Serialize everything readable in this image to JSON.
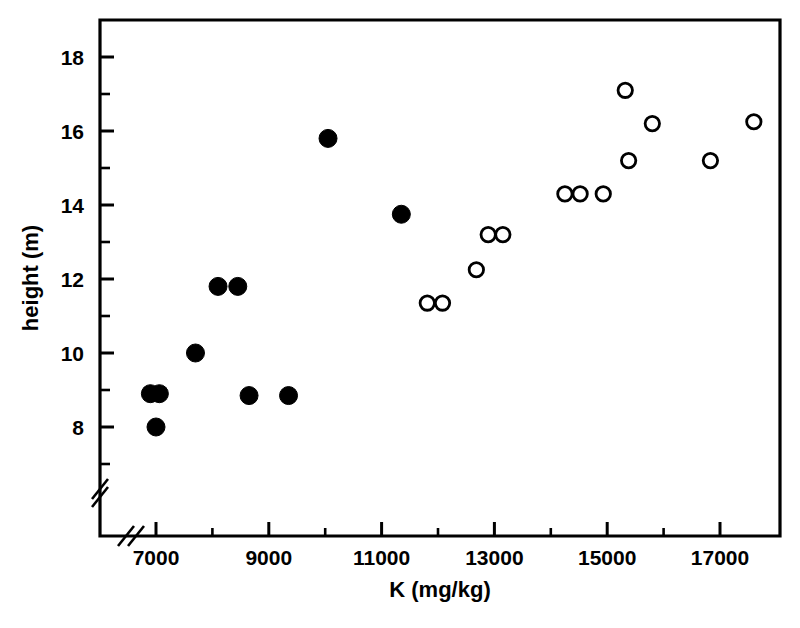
{
  "chart_data": {
    "type": "scatter",
    "title": "",
    "xlabel": "K (mg/kg)",
    "ylabel": "height (m)",
    "xlim": [
      6400,
      18000
    ],
    "ylim": [
      7.0,
      18.8
    ],
    "x_ticks": [
      7000,
      9000,
      11000,
      13000,
      15000,
      17000
    ],
    "x_tick_labels": [
      "7000",
      "9000",
      "11000",
      "13000",
      "15000",
      "17000"
    ],
    "x_minor_ticks": [
      8000,
      10000,
      12000,
      14000,
      16000
    ],
    "y_ticks": [
      8,
      10,
      12,
      14,
      16,
      18
    ],
    "y_tick_labels": [
      "8",
      "10",
      "12",
      "14",
      "16",
      "18"
    ],
    "y_minor_ticks": [
      7,
      9,
      11,
      13,
      15,
      17
    ],
    "grid": false,
    "legend": null,
    "axis_break_x": true,
    "axis_break_y": true,
    "series": [
      {
        "name": "closed-circles",
        "marker": "filled-circle",
        "color": "#000000",
        "points": [
          {
            "x": 6900,
            "y": 8.9
          },
          {
            "x": 7060,
            "y": 8.9
          },
          {
            "x": 7000,
            "y": 8.0
          },
          {
            "x": 7700,
            "y": 10.0
          },
          {
            "x": 8100,
            "y": 11.8
          },
          {
            "x": 8450,
            "y": 11.8
          },
          {
            "x": 8650,
            "y": 8.85
          },
          {
            "x": 9350,
            "y": 8.85
          },
          {
            "x": 10050,
            "y": 15.8
          },
          {
            "x": 11350,
            "y": 13.75
          }
        ]
      },
      {
        "name": "open-circles",
        "marker": "open-circle",
        "color": "#000000",
        "points": [
          {
            "x": 11810,
            "y": 11.35
          },
          {
            "x": 12080,
            "y": 11.35
          },
          {
            "x": 12680,
            "y": 12.25
          },
          {
            "x": 12890,
            "y": 13.2
          },
          {
            "x": 13150,
            "y": 13.2
          },
          {
            "x": 14250,
            "y": 14.3
          },
          {
            "x": 14520,
            "y": 14.3
          },
          {
            "x": 14930,
            "y": 14.3
          },
          {
            "x": 15320,
            "y": 17.1
          },
          {
            "x": 15380,
            "y": 15.2
          },
          {
            "x": 15800,
            "y": 16.2
          },
          {
            "x": 16830,
            "y": 15.2
          },
          {
            "x": 17600,
            "y": 16.25
          }
        ]
      }
    ]
  }
}
